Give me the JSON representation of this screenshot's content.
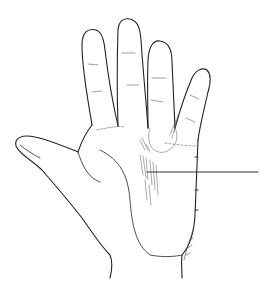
{
  "figure": {
    "alt": "Palm drawing with a horizontal pointer line marking a location in the mid-palm",
    "signature": "artist signature (illegible)",
    "colors": {
      "background": "#ffffff",
      "ink": "#222222",
      "shading": "#555555",
      "pointer": "#333333"
    }
  }
}
